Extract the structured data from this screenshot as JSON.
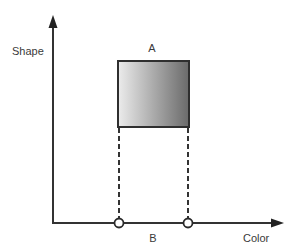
{
  "diagram": {
    "axes": {
      "y_label": "Shape",
      "x_label": "Color",
      "color": "#333333"
    },
    "region": {
      "label": "A",
      "gradient_start": "#ececec",
      "gradient_end": "#6a6a6a",
      "border_color": "#2f2f2f"
    },
    "projection": {
      "label": "B",
      "marker_shape": "open-circle",
      "line_style": "dashed"
    }
  }
}
